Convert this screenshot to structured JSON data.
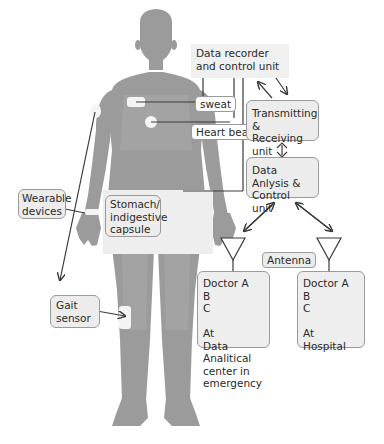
{
  "diagram": {
    "colors": {
      "body": "#9b9b9b",
      "box_fill": "#ececec",
      "box_border": "#9a9a9a",
      "line": "#3a3a3a",
      "sensor": "#f4f4f4"
    },
    "body_labels": {
      "sweat": "sweat",
      "heart_beat": "Heart beat",
      "wearable_devices": "Wearable devices",
      "stomach_capsule": "Stomach/ indigestive capsule",
      "gait_sensor": "Gait sensor"
    },
    "units": {
      "data_recorder": "Data recorder and control unit",
      "transmitting": "Transmitting & Receiving unit",
      "data_analysis": "Data Anlysis & Control unit",
      "antenna": "Antenna"
    },
    "doctor_left": {
      "lines": [
        "Doctor A",
        "B",
        "C",
        "",
        "At",
        "Data Analitical",
        "center in",
        "emergency"
      ]
    },
    "doctor_right": {
      "lines": [
        "Doctor A",
        "B",
        "C",
        "",
        "At",
        "Hospital"
      ]
    }
  }
}
